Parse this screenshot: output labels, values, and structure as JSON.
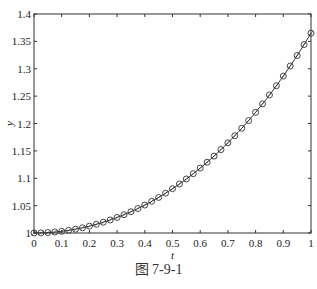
{
  "chart_data": {
    "type": "line",
    "title": "",
    "xlabel": "t",
    "ylabel": "y",
    "xlim": [
      0,
      1
    ],
    "ylim": [
      1,
      1.4
    ],
    "grid": false,
    "xticks": [
      "0",
      "0.1",
      "0.2",
      "0.3",
      "0.4",
      "0.5",
      "0.6",
      "0.7",
      "0.8",
      "0.9",
      "1"
    ],
    "yticks": [
      "1",
      "1.05",
      "1.1",
      "1.15",
      "1.2",
      "1.25",
      "1.3",
      "1.35",
      "1.4"
    ],
    "series": [
      {
        "name": "y(t)",
        "line": "solid",
        "marker": "circle",
        "x_step": 0.025,
        "x": [
          0,
          0.1,
          0.2,
          0.3,
          0.4,
          0.5,
          0.6,
          0.7,
          0.8,
          0.9,
          1.0
        ],
        "values": [
          1.0,
          1.003,
          1.013,
          1.028,
          1.051,
          1.081,
          1.118,
          1.164,
          1.22,
          1.286,
          1.365
        ]
      }
    ]
  },
  "caption": "图 7-9-1"
}
